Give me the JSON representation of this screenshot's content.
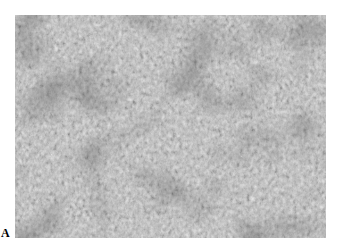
{
  "figure": {
    "panel_label": "A",
    "image": {
      "description": "grayscale photomicrograph of densely packed cells (histology tissue section)",
      "tone": "grayscale",
      "base_color": "#8a8a8a",
      "dark_color": "#2e2e2e",
      "light_color": "#e6e6e6"
    },
    "background_color": "#ffffff"
  }
}
